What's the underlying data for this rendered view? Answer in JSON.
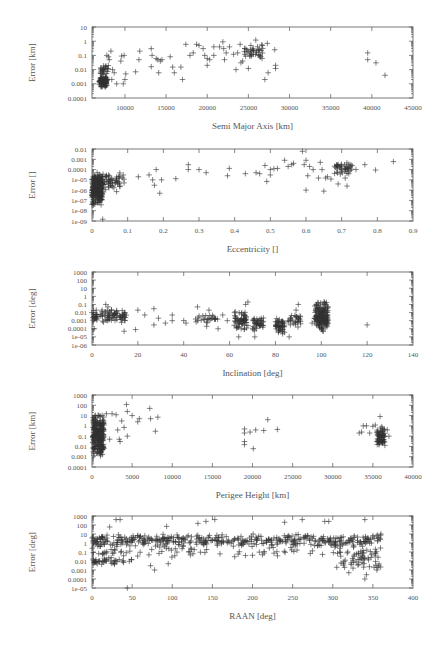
{
  "chart_data": [
    {
      "id": "sma",
      "type": "scatter",
      "title": "",
      "xlabel": "Semi Major Axis [km]",
      "ylabel": "Error [km]",
      "yscale": "log",
      "xlim": [
        6000,
        45000
      ],
      "ylim": [
        0.0001,
        10
      ],
      "xticks": [
        10000,
        15000,
        20000,
        25000,
        30000,
        35000,
        40000,
        45000
      ],
      "xtick_labels": [
        "10000",
        "15000",
        "20000",
        "25000",
        "30000",
        "35000",
        "40000",
        "45000"
      ],
      "yticks": [
        10,
        1,
        0.1,
        0.01,
        0.001,
        0.0001
      ],
      "ytick_labels": [
        "10",
        "1",
        "0.1",
        "0.01",
        "0.001",
        "0.0001"
      ],
      "grid": false,
      "legend": null,
      "box": {
        "x0": 92,
        "x1": 413,
        "y0": 27,
        "y1": 98
      },
      "clusters": [
        {
          "x": [
            6900,
            7800
          ],
          "y": [
            0.0005,
            0.004
          ],
          "n": 110
        },
        {
          "x": [
            7000,
            8000
          ],
          "y": [
            0.004,
            0.03
          ],
          "n": 25
        },
        {
          "x": [
            24500,
            26800
          ],
          "y": [
            0.05,
            0.6
          ],
          "n": 35
        }
      ],
      "points": [
        [
          7800,
          0.1
        ],
        [
          8000,
          0.08
        ],
        [
          8300,
          0.2
        ],
        [
          8100,
          0.05
        ],
        [
          8500,
          0.01
        ],
        [
          8700,
          0.006
        ],
        [
          8400,
          0.002
        ],
        [
          9000,
          0.001
        ],
        [
          9500,
          0.04
        ],
        [
          9600,
          0.09
        ],
        [
          9900,
          0.1
        ],
        [
          9800,
          0.001
        ],
        [
          10000,
          0.002
        ],
        [
          10100,
          0.005
        ],
        [
          11300,
          0.007
        ],
        [
          11800,
          0.2
        ],
        [
          11700,
          0.05
        ],
        [
          13200,
          0.3
        ],
        [
          13300,
          0.1
        ],
        [
          13200,
          0.016
        ],
        [
          13800,
          0.06
        ],
        [
          14000,
          0.05
        ],
        [
          14100,
          0.006
        ],
        [
          14300,
          0.04
        ],
        [
          14500,
          0.05
        ],
        [
          15500,
          0.08
        ],
        [
          15800,
          0.015
        ],
        [
          16000,
          0.006
        ],
        [
          16800,
          0.015
        ],
        [
          17000,
          0.002
        ],
        [
          17400,
          0.6
        ],
        [
          17900,
          0.1
        ],
        [
          18300,
          0.15
        ],
        [
          18700,
          0.6
        ],
        [
          19000,
          0.5
        ],
        [
          19500,
          0.3
        ],
        [
          19700,
          0.1
        ],
        [
          20000,
          0.02
        ],
        [
          20000,
          0.06
        ],
        [
          20300,
          0.05
        ],
        [
          20800,
          0.1
        ],
        [
          20800,
          0.4
        ],
        [
          21500,
          0.4
        ],
        [
          21900,
          0.9
        ],
        [
          22000,
          0.3
        ],
        [
          22100,
          0.05
        ],
        [
          22300,
          0.15
        ],
        [
          22700,
          0.4
        ],
        [
          23200,
          0.12
        ],
        [
          23500,
          0.01
        ],
        [
          23700,
          0.15
        ],
        [
          24000,
          0.6
        ],
        [
          24100,
          0.03
        ],
        [
          24300,
          0.04
        ],
        [
          25000,
          0.012
        ],
        [
          25300,
          0.5
        ],
        [
          25900,
          1.2
        ],
        [
          26000,
          0.2
        ],
        [
          26500,
          0.08
        ],
        [
          26700,
          0.5
        ],
        [
          27000,
          0.002
        ],
        [
          27300,
          0.7
        ],
        [
          27400,
          0.006
        ],
        [
          28200,
          0.25
        ],
        [
          28300,
          0.02
        ],
        [
          28300,
          0.012
        ],
        [
          39500,
          0.15
        ],
        [
          39500,
          0.05
        ],
        [
          40500,
          0.03
        ],
        [
          41600,
          0.004
        ]
      ]
    },
    {
      "id": "ecc",
      "type": "scatter",
      "title": "",
      "xlabel": "Eccentricity []",
      "ylabel": "Error []",
      "yscale": "log",
      "xlim": [
        0,
        0.9
      ],
      "ylim": [
        1e-09,
        0.01
      ],
      "xticks": [
        0,
        0.1,
        0.2,
        0.3,
        0.4,
        0.5,
        0.6,
        0.7,
        0.8,
        0.9
      ],
      "xtick_labels": [
        "0",
        "0.1",
        "0.2",
        "0.3",
        "0.4",
        "0.5",
        "0.6",
        "0.7",
        "0.8",
        "0.9"
      ],
      "yticks": [
        0.01,
        0.001,
        0.0001,
        1e-05,
        1e-06,
        1e-07,
        1e-08,
        1e-09
      ],
      "ytick_labels": [
        "0.01",
        "0.001",
        "0.0001",
        "1e-05",
        "1e-06",
        "1e-07",
        "1e-08",
        "1e-09"
      ],
      "grid": false,
      "legend": null,
      "box": {
        "x0": 92,
        "x1": 413,
        "y0": 149,
        "y1": 221
      },
      "clusters": [
        {
          "x": [
            0,
            0.03
          ],
          "y": [
            3e-08,
            6e-05
          ],
          "n": 260
        },
        {
          "x": [
            0.02,
            0.09
          ],
          "y": [
            5e-07,
            6e-05
          ],
          "n": 60
        },
        {
          "x": [
            0.68,
            0.73
          ],
          "y": [
            3e-05,
            0.001
          ],
          "n": 40
        }
      ],
      "points": [
        [
          0.03,
          1.5e-09
        ],
        [
          0.13,
          2e-05
        ],
        [
          0.16,
          3e-05
        ],
        [
          0.17,
          1e-05
        ],
        [
          0.175,
          3e-06
        ],
        [
          0.18,
          0.0001
        ],
        [
          0.19,
          5e-07
        ],
        [
          0.195,
          1e-05
        ],
        [
          0.235,
          1.3e-05
        ],
        [
          0.27,
          0.0001
        ],
        [
          0.27,
          0.0003
        ],
        [
          0.3,
          0.0001
        ],
        [
          0.32,
          5e-05
        ],
        [
          0.38,
          2.5e-05
        ],
        [
          0.385,
          0.00013
        ],
        [
          0.43,
          4e-05
        ],
        [
          0.46,
          5e-05
        ],
        [
          0.47,
          4e-05
        ],
        [
          0.485,
          0.00025
        ],
        [
          0.49,
          7e-06
        ],
        [
          0.5,
          3e-05
        ],
        [
          0.5,
          0.0001
        ],
        [
          0.51,
          0.00012
        ],
        [
          0.52,
          0.00013
        ],
        [
          0.54,
          0.0008
        ],
        [
          0.55,
          0.0002
        ],
        [
          0.56,
          0.0003
        ],
        [
          0.565,
          0.0004
        ],
        [
          0.59,
          0.006
        ],
        [
          0.595,
          0.0003
        ],
        [
          0.6,
          1e-06
        ],
        [
          0.6,
          0.0008
        ],
        [
          0.605,
          2.5e-05
        ],
        [
          0.61,
          0.0002
        ],
        [
          0.62,
          0.0001
        ],
        [
          0.635,
          1.5e-05
        ],
        [
          0.64,
          0.0005
        ],
        [
          0.645,
          0.0001
        ],
        [
          0.65,
          8e-07
        ],
        [
          0.655,
          1.5e-05
        ],
        [
          0.66,
          2e-05
        ],
        [
          0.67,
          1.2e-05
        ],
        [
          0.69,
          4e-06
        ],
        [
          0.7,
          0.0001
        ],
        [
          0.71,
          1.5e-05
        ],
        [
          0.715,
          2.5e-06
        ],
        [
          0.72,
          4e-05
        ],
        [
          0.74,
          0.0001
        ],
        [
          0.765,
          0.0003
        ],
        [
          0.795,
          9e-05
        ],
        [
          0.845,
          0.0006
        ]
      ]
    },
    {
      "id": "inc",
      "type": "scatter",
      "title": "",
      "xlabel": "Inclination [deg]",
      "ylabel": "Error [deg]",
      "yscale": "log",
      "xlim": [
        0,
        140
      ],
      "ylim": [
        1e-06,
        1000
      ],
      "xticks": [
        0,
        20,
        40,
        60,
        80,
        100,
        120,
        140
      ],
      "xtick_labels": [
        "0",
        "20",
        "40",
        "60",
        "80",
        "100",
        "120",
        "140"
      ],
      "yticks": [
        1000,
        100,
        10,
        1,
        0.1,
        0.01,
        0.001,
        0.0001,
        1e-05,
        1e-06
      ],
      "ytick_labels": [
        "1000",
        "100",
        "10",
        "1",
        "0.1",
        "0.01",
        "0.001",
        "0.0001",
        "1e-05",
        "1e-06"
      ],
      "grid": false,
      "legend": null,
      "box": {
        "x0": 92,
        "x1": 413,
        "y0": 272,
        "y1": 345
      },
      "clusters": [
        {
          "x": [
            0,
            15
          ],
          "y": [
            0.0005,
            0.03
          ],
          "n": 90
        },
        {
          "x": [
            45,
            55
          ],
          "y": [
            0.0005,
            0.008
          ],
          "n": 25
        },
        {
          "x": [
            62,
            68
          ],
          "y": [
            5e-05,
            0.02
          ],
          "n": 60
        },
        {
          "x": [
            70,
            75
          ],
          "y": [
            5e-05,
            0.003
          ],
          "n": 40
        },
        {
          "x": [
            80,
            84
          ],
          "y": [
            2e-05,
            0.002
          ],
          "n": 50
        },
        {
          "x": [
            85,
            91
          ],
          "y": [
            0.0001,
            0.01
          ],
          "n": 30
        },
        {
          "x": [
            97,
            103
          ],
          "y": [
            3e-05,
            0.3
          ],
          "n": 170
        }
      ],
      "points": [
        [
          0,
          0.01
        ],
        [
          1,
          0.0001
        ],
        [
          6,
          0.1
        ],
        [
          7,
          0.05
        ],
        [
          14,
          5e-05
        ],
        [
          19,
          8e-05
        ],
        [
          20,
          0.02
        ],
        [
          23,
          0.005
        ],
        [
          27,
          0.03
        ],
        [
          27,
          0.0003
        ],
        [
          29,
          0.002
        ],
        [
          32,
          0.0005
        ],
        [
          35,
          0.005
        ],
        [
          35,
          0.001
        ],
        [
          40,
          0.001
        ],
        [
          41,
          0.0005
        ],
        [
          46,
          0.05
        ],
        [
          50,
          0.0002
        ],
        [
          51,
          0.02
        ],
        [
          55,
          0.0001
        ],
        [
          57,
          0.005
        ],
        [
          59,
          0.001
        ],
        [
          64,
          1e-05
        ],
        [
          67,
          0.1
        ],
        [
          68,
          0.2
        ],
        [
          71,
          1e-05
        ],
        [
          86,
          1e-05
        ],
        [
          89,
          0.02
        ],
        [
          90,
          0.1
        ],
        [
          96,
          0.0005
        ],
        [
          120,
          0.0003
        ]
      ]
    },
    {
      "id": "perigee",
      "type": "scatter",
      "title": "",
      "xlabel": "Perigee Height [km]",
      "ylabel": "Error [km]",
      "yscale": "log",
      "xlim": [
        0,
        40000
      ],
      "ylim": [
        0.0001,
        1000
      ],
      "xticks": [
        0,
        5000,
        10000,
        15000,
        20000,
        25000,
        30000,
        35000,
        40000
      ],
      "xtick_labels": [
        "0",
        "5000",
        "10000",
        "15000",
        "20000",
        "25000",
        "30000",
        "35000",
        "40000"
      ],
      "yticks": [
        1000,
        100,
        10,
        1,
        0.1,
        0.01,
        0.001,
        0.0001
      ],
      "ytick_labels": [
        "1000",
        "100",
        "10",
        "1",
        "0.1",
        "0.01",
        "0.001",
        "0.0001"
      ],
      "grid": false,
      "legend": null,
      "box": {
        "x0": 92,
        "x1": 413,
        "y0": 395,
        "y1": 467
      },
      "clusters": [
        {
          "x": [
            100,
            1500
          ],
          "y": [
            0.0007,
            20
          ],
          "n": 260
        },
        {
          "x": [
            35500,
            36500
          ],
          "y": [
            0.01,
            1
          ],
          "n": 70
        }
      ],
      "points": [
        [
          1800,
          15
        ],
        [
          2200,
          0.05
        ],
        [
          2500,
          15
        ],
        [
          3000,
          12
        ],
        [
          3200,
          0.4
        ],
        [
          3400,
          0.05
        ],
        [
          3500,
          0.03
        ],
        [
          3700,
          3
        ],
        [
          4000,
          0.7
        ],
        [
          4300,
          120
        ],
        [
          4400,
          25
        ],
        [
          4400,
          0.1
        ],
        [
          5000,
          10
        ],
        [
          5700,
          2.5
        ],
        [
          5900,
          5
        ],
        [
          7200,
          50
        ],
        [
          7300,
          5
        ],
        [
          7900,
          0.3
        ],
        [
          8200,
          7
        ],
        [
          19000,
          0.5
        ],
        [
          19000,
          0.2
        ],
        [
          19000,
          0.03
        ],
        [
          19000,
          0.015
        ],
        [
          19700,
          0.25
        ],
        [
          20100,
          0.006
        ],
        [
          20400,
          0.4
        ],
        [
          21400,
          0.35
        ],
        [
          21900,
          4
        ],
        [
          23100,
          0.45
        ],
        [
          33300,
          0.2
        ],
        [
          33600,
          0.25
        ],
        [
          33800,
          1
        ],
        [
          34200,
          1
        ],
        [
          34600,
          0.2
        ],
        [
          35000,
          0.9
        ],
        [
          35300,
          1.2
        ],
        [
          35900,
          8
        ],
        [
          36800,
          0.4
        ],
        [
          37000,
          0.1
        ]
      ]
    },
    {
      "id": "raan",
      "type": "scatter",
      "title": "",
      "xlabel": "RAAN [deg]",
      "ylabel": "Error [deg]",
      "yscale": "log",
      "xlim": [
        0,
        400
      ],
      "ylim": [
        1e-05,
        1000
      ],
      "xticks": [
        0,
        50,
        100,
        150,
        200,
        250,
        300,
        350,
        400
      ],
      "xtick_labels": [
        "0",
        "50",
        "100",
        "150",
        "200",
        "250",
        "300",
        "350",
        "400"
      ],
      "yticks": [
        1000,
        100,
        10,
        1,
        0.1,
        0.01,
        0.001,
        0.0001,
        1e-05
      ],
      "ytick_labels": [
        "1000",
        "100",
        "10",
        "1",
        "0.1",
        "0.01",
        "0.001",
        "0.0001",
        "1e-05"
      ],
      "grid": false,
      "legend": null,
      "box": {
        "x0": 92,
        "x1": 413,
        "y0": 516,
        "y1": 588
      },
      "clusters": [
        {
          "x": [
            0,
            360
          ],
          "y": [
            0.3,
            12
          ],
          "n": 420
        },
        {
          "x": [
            0,
            360
          ],
          "y": [
            0.02,
            0.5
          ],
          "n": 90
        },
        {
          "x": [
            0,
            50
          ],
          "y": [
            0.003,
            0.03
          ],
          "n": 40
        },
        {
          "x": [
            310,
            360
          ],
          "y": [
            0.001,
            0.1
          ],
          "n": 45
        }
      ],
      "points": [
        [
          30,
          400
        ],
        [
          35,
          400
        ],
        [
          22,
          60
        ],
        [
          44,
          1e-05
        ],
        [
          73,
          0.003
        ],
        [
          78,
          0.001
        ],
        [
          93,
          70
        ],
        [
          95,
          0.005
        ],
        [
          132,
          150
        ],
        [
          142,
          250
        ],
        [
          153,
          400
        ],
        [
          240,
          200
        ],
        [
          262,
          400
        ],
        [
          290,
          250
        ],
        [
          295,
          250
        ],
        [
          305,
          0.002
        ],
        [
          320,
          0.0005
        ],
        [
          340,
          400
        ],
        [
          340,
          0.0001
        ],
        [
          342,
          0.0003
        ],
        [
          355,
          0.001
        ],
        [
          360,
          10
        ]
      ]
    }
  ]
}
